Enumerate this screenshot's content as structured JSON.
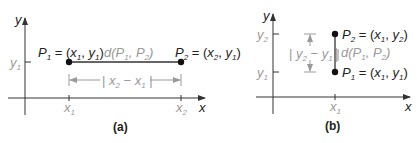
{
  "figure_a": {
    "caption": "(a)",
    "x_axis_label": "x",
    "y_axis_label": "y",
    "y_tick_label": {
      "base": "y",
      "sub": "1"
    },
    "x_tick_labels": [
      {
        "base": "x",
        "sub": "1"
      },
      {
        "base": "x",
        "sub": "2"
      }
    ],
    "point1": {
      "name": "P",
      "sub": "1",
      "coords": [
        "x",
        "1",
        "y",
        "1"
      ]
    },
    "point2": {
      "name": "P",
      "sub": "2",
      "coords": [
        "x",
        "2",
        "y",
        "1"
      ]
    },
    "distance_label": {
      "d": "d(P",
      "s1": "1",
      "mid": ", P",
      "s2": "2",
      "end": ")"
    },
    "horizontal_distance": {
      "base1": "x",
      "sub1": "2",
      "minus": " − ",
      "base2": "x",
      "sub2": "1"
    }
  },
  "figure_b": {
    "caption": "(b)",
    "x_axis_label": "x",
    "y_axis_label": "y",
    "y_tick_labels": [
      {
        "base": "y",
        "sub": "2"
      },
      {
        "base": "y",
        "sub": "1"
      }
    ],
    "x_tick_label": {
      "base": "x",
      "sub": "1"
    },
    "point1": {
      "name": "P",
      "sub": "1",
      "coords": [
        "x",
        "1",
        "y",
        "1"
      ]
    },
    "point2": {
      "name": "P",
      "sub": "2",
      "coords": [
        "x",
        "1",
        "y",
        "2"
      ]
    },
    "distance_label": {
      "d": "d(P",
      "s1": "1",
      "mid": ", P",
      "s2": "2",
      "end": ")"
    },
    "vertical_distance": {
      "base1": "y",
      "sub1": "2",
      "minus": " − ",
      "base2": "y",
      "sub2": "1"
    }
  },
  "colors": {
    "ink": "#222222",
    "gray": "#9a9a9a",
    "axis": "#333333"
  }
}
